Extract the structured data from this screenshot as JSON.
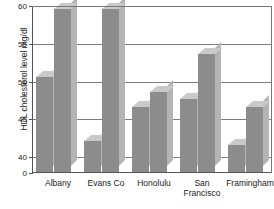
{
  "chart_data": {
    "type": "bar",
    "title": "",
    "subtitle": "",
    "xlabel": "",
    "ylabel": "HDL cholesterol level mg/dl",
    "categories": [
      "Albany",
      "Evans Co",
      "Honolulu",
      "San\nFrancisco",
      "Framingham"
    ],
    "series": [
      {
        "name": "series-1",
        "values": [
          50.5,
          42.0,
          46.5,
          47.5,
          41.5
        ]
      },
      {
        "name": "series-2",
        "values": [
          59.5,
          59.5,
          48.5,
          53.5,
          46.5
        ]
      }
    ],
    "ylim": [
      40,
      60
    ],
    "axis_break_label": "0",
    "ytick_labels": [
      "60",
      "55",
      "50",
      "45",
      "40",
      "0"
    ],
    "ytick_values": [
      60,
      55,
      50,
      45,
      40
    ],
    "minor_gridline_step": 1,
    "grid": true,
    "legend": "none",
    "style_3d": true,
    "colors": {
      "bar_face": "#8c8c8c",
      "bar_top": "#c9c9c9",
      "bar_side": "#b4b4b4",
      "gridline": "#9a9a9a",
      "axis": "#555555",
      "text": "#1a1a1a",
      "background": "#ffffff"
    }
  }
}
